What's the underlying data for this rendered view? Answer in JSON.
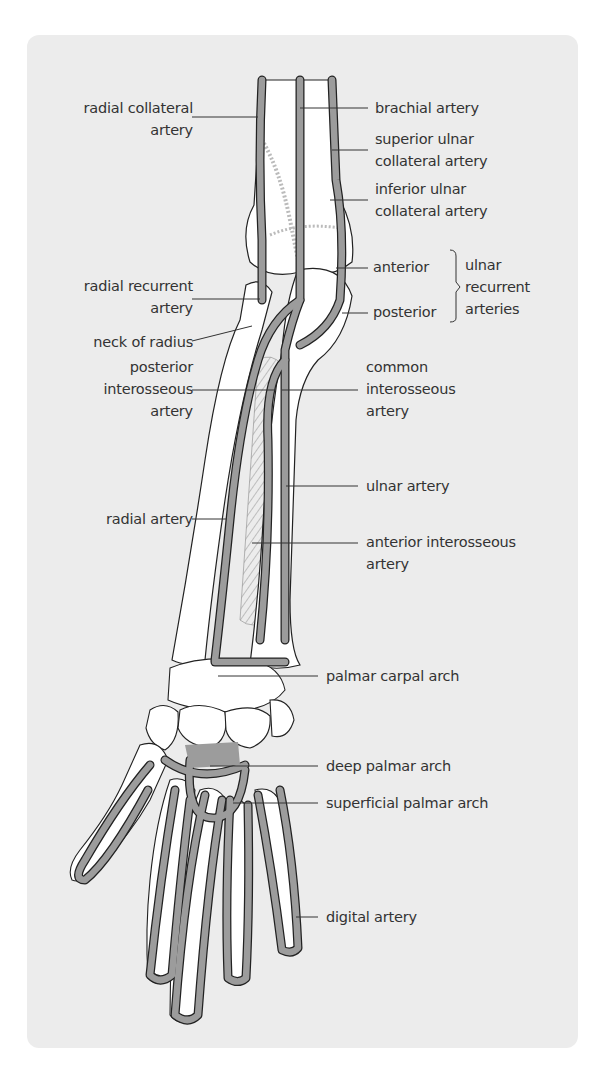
{
  "figure": {
    "colors": {
      "panel_background": "#ececec",
      "page_background": "#ffffff",
      "artery_fill": "#9c9c9c",
      "bone_fill": "#ffffff",
      "outline": "#222222",
      "label_text": "#333333"
    }
  },
  "labels_left": [
    {
      "id": "radial-collateral-artery",
      "lines": [
        "radial collateral",
        "artery"
      ]
    },
    {
      "id": "radial-recurrent-artery",
      "lines": [
        "radial recurrent",
        "artery"
      ]
    },
    {
      "id": "neck-of-radius",
      "lines": [
        "neck of radius"
      ]
    },
    {
      "id": "posterior-interosseous-artery",
      "lines": [
        "posterior",
        "interosseous",
        "artery"
      ]
    },
    {
      "id": "radial-artery",
      "lines": [
        "radial artery"
      ]
    }
  ],
  "labels_right": [
    {
      "id": "brachial-artery",
      "lines": [
        "brachial artery"
      ]
    },
    {
      "id": "superior-ulnar-collateral-artery",
      "lines": [
        "superior ulnar",
        "collateral artery"
      ]
    },
    {
      "id": "inferior-ulnar-collateral-artery",
      "lines": [
        "inferior ulnar",
        "collateral artery"
      ]
    },
    {
      "id": "anterior",
      "lines": [
        "anterior"
      ]
    },
    {
      "id": "posterior",
      "lines": [
        "posterior"
      ]
    },
    {
      "id": "ulnar-recurrent-arteries",
      "lines": [
        "ulnar",
        "recurrent",
        "arteries"
      ]
    },
    {
      "id": "common-interosseous-artery",
      "lines": [
        "common",
        "interosseous",
        "artery"
      ]
    },
    {
      "id": "ulnar-artery",
      "lines": [
        "ulnar artery"
      ]
    },
    {
      "id": "anterior-interosseous-artery",
      "lines": [
        "anterior interosseous",
        "artery"
      ]
    },
    {
      "id": "palmar-carpal-arch",
      "lines": [
        "palmar carpal arch"
      ]
    },
    {
      "id": "deep-palmar-arch",
      "lines": [
        "deep palmar arch"
      ]
    },
    {
      "id": "superficial-palmar-arch",
      "lines": [
        "superficial palmar arch"
      ]
    },
    {
      "id": "digital-artery",
      "lines": [
        "digital artery"
      ]
    }
  ]
}
